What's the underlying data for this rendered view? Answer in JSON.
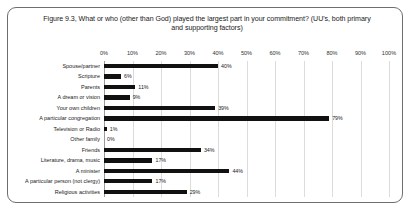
{
  "chart_data": {
    "type": "bar",
    "orientation": "horizontal",
    "title": "Figure 9.3, What or who (other than God) played the largest part in your commitment? (UU's, both primary and supporting factors)",
    "xlabel": "",
    "ylabel": "",
    "xlim": [
      0,
      100
    ],
    "grid": true,
    "legend": "none",
    "xticks": [
      "0%",
      "10%",
      "20%",
      "30%",
      "40%",
      "50%",
      "60%",
      "70%",
      "80%",
      "90%",
      "100%"
    ],
    "xtick_values": [
      0,
      10,
      20,
      30,
      40,
      50,
      60,
      70,
      80,
      90,
      100
    ],
    "bar_color": "#111111",
    "categories": [
      "Spouse/partner",
      "Scripture",
      "Parents",
      "A dream or vision",
      "Your own children",
      "A particular congregation",
      "Television or Radio",
      "Other family",
      "Friends",
      "Literature, drama, music",
      "A minister",
      "A particular person (not clergy)",
      "Religious activities"
    ],
    "values": [
      40,
      6,
      11,
      9,
      39,
      79,
      1,
      0,
      34,
      17,
      44,
      17,
      29
    ],
    "data_labels": [
      "40%",
      "6%",
      "11%",
      "9%",
      "39%",
      "79%",
      "1%",
      "0%",
      "34%",
      "17%",
      "44%",
      "17%",
      "29%"
    ]
  }
}
